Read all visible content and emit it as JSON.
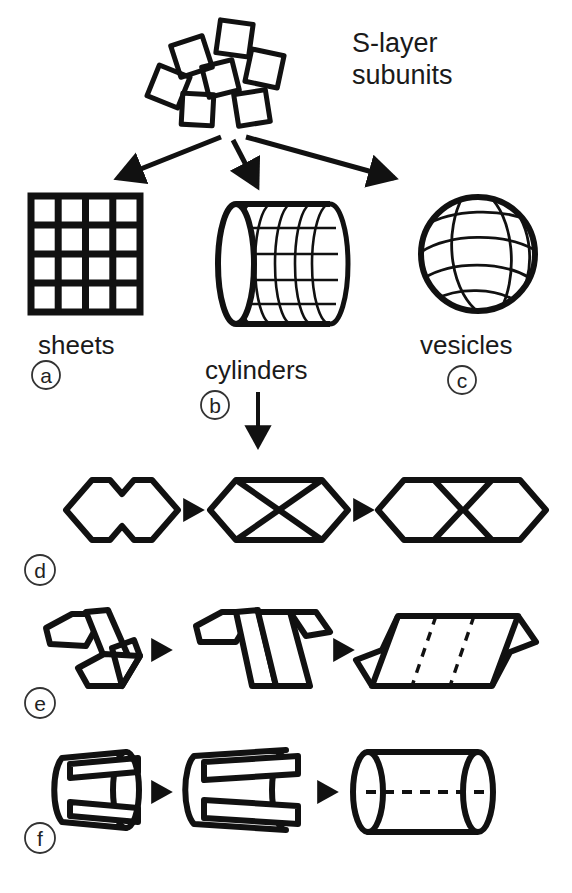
{
  "figure": {
    "background": "#ffffff",
    "ink": "#111111",
    "width": 572,
    "height": 893
  },
  "labels": {
    "subunits": "S-layer\nsubunits",
    "sheets": "sheets",
    "cylinders": "cylinders",
    "vesicles": "vesicles"
  },
  "panel_markers": [
    {
      "id": "a",
      "letter": "a",
      "x": 46,
      "y": 375
    },
    {
      "id": "b",
      "letter": "b",
      "x": 215,
      "y": 405
    },
    {
      "id": "c",
      "letter": "c",
      "x": 462,
      "y": 380
    },
    {
      "id": "d",
      "letter": "d",
      "x": 40,
      "y": 570
    },
    {
      "id": "e",
      "letter": "e",
      "x": 40,
      "y": 703
    },
    {
      "id": "f",
      "letter": "f",
      "x": 40,
      "y": 838
    }
  ],
  "subunit_squares": [
    {
      "x": 175,
      "y": 40,
      "size": 33,
      "rot": -18
    },
    {
      "x": 218,
      "y": 22,
      "size": 33,
      "rot": 8
    },
    {
      "x": 152,
      "y": 70,
      "size": 33,
      "rot": 22
    },
    {
      "x": 205,
      "y": 63,
      "size": 31,
      "rot": -14
    },
    {
      "x": 248,
      "y": 52,
      "size": 33,
      "rot": 12
    },
    {
      "x": 182,
      "y": 94,
      "size": 31,
      "rot": 3
    },
    {
      "x": 236,
      "y": 92,
      "size": 32,
      "rot": -9
    }
  ],
  "branch_arrows": [
    {
      "name": "to-sheets",
      "x1": 221,
      "y1": 137,
      "x2": 112,
      "y2": 182
    },
    {
      "name": "to-cylinders",
      "x1": 232,
      "y1": 140,
      "x2": 258,
      "y2": 190
    },
    {
      "name": "to-vesicles",
      "x1": 244,
      "y1": 137,
      "x2": 400,
      "y2": 182
    },
    {
      "name": "cylinders-to-d",
      "x1": 258,
      "y1": 388,
      "x2": 258,
      "y2": 448
    }
  ],
  "rows": [
    {
      "id": "d",
      "name": "hexagon-assembly-row",
      "stages": [
        "notched-hexagon",
        "crossed-hexagon",
        "elongated-hexagon-tube"
      ]
    },
    {
      "id": "e",
      "name": "folded-sheet-row",
      "stages": [
        "zigzag-fold",
        "double-fold",
        "flat-sheet-with-creases"
      ],
      "crease_count": 2
    },
    {
      "id": "f",
      "name": "cylinder-rolling-row",
      "stages": [
        "open-roll",
        "overlapping-roll",
        "closed-cylinder-with-seam"
      ]
    }
  ],
  "sheet_grid": {
    "rows": 4,
    "cols": 4
  },
  "cylinder_grid": {
    "rings": 5,
    "rails": 4
  },
  "vesicle_grid": {
    "meridians": 4,
    "parallels": 4
  }
}
